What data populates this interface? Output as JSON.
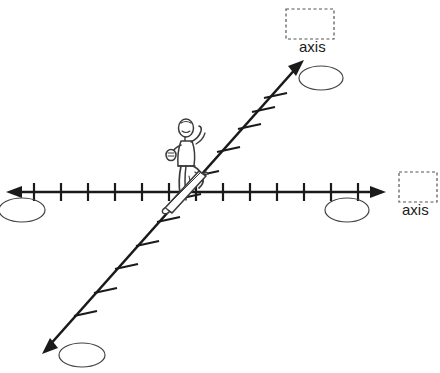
{
  "canvas": {
    "width": 440,
    "height": 373,
    "background": "#ffffff",
    "stroke_color": "#1a1a1a",
    "figure_stroke": "#3b3b3b",
    "dashed_box_color": "#555555"
  },
  "diagram": {
    "title": "",
    "type": "hand-drawn coordinate axes with skateboarder"
  },
  "labels": {
    "axis_top": "axis",
    "axis_right": "axis"
  },
  "axes": [
    {
      "name": "horizontal-axis",
      "orientation": "horizontal",
      "double_headed": true,
      "start": {
        "x": 8,
        "y": 192
      },
      "end": {
        "x": 384,
        "y": 192
      },
      "tick_count": 13,
      "tick_spacing": 27,
      "tick_length": 18
    },
    {
      "name": "diagonal-axis",
      "orientation": "diagonal",
      "double_headed": true,
      "start": {
        "x": 44,
        "y": 352
      },
      "end": {
        "x": 302,
        "y": 62
      },
      "tick_count": 11,
      "tick_length": 18
    }
  ],
  "dashed_boxes": [
    {
      "name": "axis-box-top",
      "x": 286,
      "y": 9,
      "width": 48,
      "height": 30,
      "label": "axis"
    },
    {
      "name": "axis-box-right",
      "x": 399,
      "y": 172,
      "width": 38,
      "height": 30,
      "label": "axis"
    }
  ],
  "ellipses": [
    {
      "name": "ellipse-top-right",
      "cx": 321,
      "cy": 78,
      "rx": 22,
      "ry": 12
    },
    {
      "name": "ellipse-right",
      "cx": 347,
      "cy": 210,
      "rx": 22,
      "ry": 12
    },
    {
      "name": "ellipse-left",
      "cx": 22,
      "cy": 210,
      "rx": 23,
      "ry": 12
    },
    {
      "name": "ellipse-bottom-left",
      "cx": 82,
      "cy": 355,
      "rx": 23,
      "ry": 12
    }
  ],
  "figure": {
    "name": "skateboarder-figure",
    "center": {
      "x": 190,
      "y": 160
    }
  }
}
